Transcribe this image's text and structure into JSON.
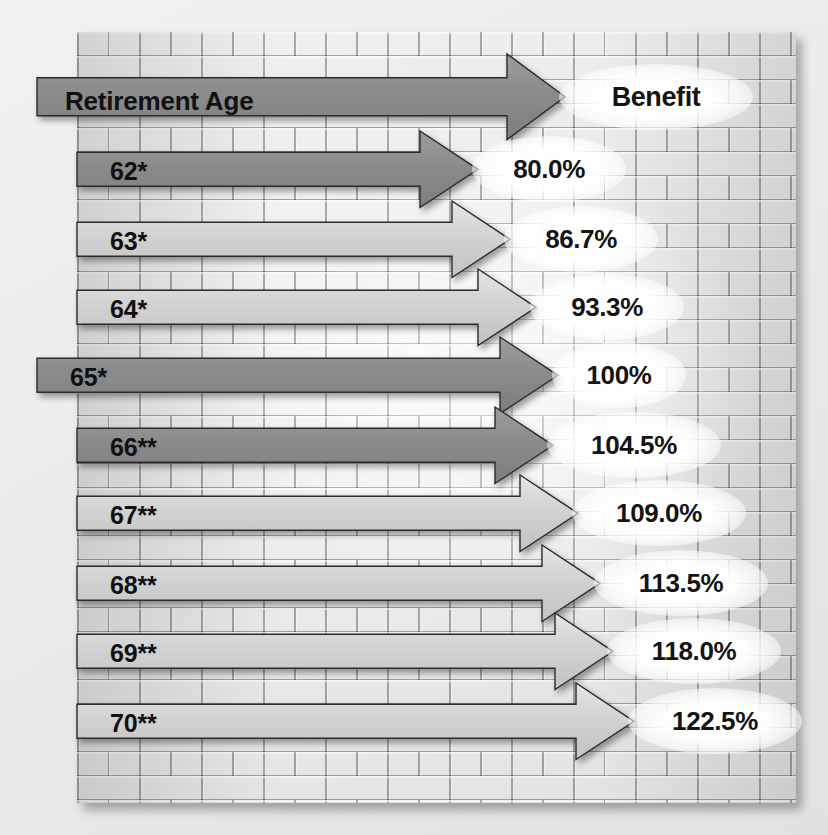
{
  "chart_data": {
    "type": "bar",
    "xlabel": "Benefit",
    "ylabel": "Retirement Age",
    "header": {
      "left": "Retirement Age",
      "right": "Benefit"
    },
    "categories": [
      "62*",
      "63*",
      "64*",
      "65*",
      "66**",
      "67**",
      "68**",
      "69**",
      "70**"
    ],
    "values": [
      80.0,
      86.7,
      93.3,
      100,
      104.5,
      109.0,
      113.5,
      118.0,
      122.5
    ],
    "value_labels": [
      "80.0%",
      "86.7%",
      "93.3%",
      "100%",
      "104.5%",
      "109.0%",
      "113.5%",
      "118.0%",
      "122.5%"
    ],
    "grid": true,
    "legend": "none",
    "accent_dark": "#8a8a8a",
    "accent_light": "#d8d8d8",
    "text_color": "#141414"
  },
  "rows": [
    {
      "id": "header",
      "label": "Retirement Age",
      "value": "Benefit",
      "shade": "dark",
      "start": -40,
      "tip": 488,
      "top": 78,
      "h": 38
    },
    {
      "id": "age-62",
      "label": "62*",
      "value": "80.0%",
      "shade": "dark",
      "start": 0,
      "tip": 401,
      "top": 152,
      "h": 34
    },
    {
      "id": "age-63",
      "label": "63*",
      "value": "86.7%",
      "shade": "light",
      "start": 0,
      "tip": 433,
      "top": 222,
      "h": 34
    },
    {
      "id": "age-64",
      "label": "64*",
      "value": "93.3%",
      "shade": "light",
      "start": 0,
      "tip": 459,
      "top": 290,
      "h": 34
    },
    {
      "id": "age-65",
      "label": "65*",
      "value": "100%",
      "shade": "dark",
      "start": -40,
      "tip": 481,
      "top": 358,
      "h": 34
    },
    {
      "id": "age-66",
      "label": "66**",
      "value": "104.5%",
      "shade": "dark",
      "start": 0,
      "tip": 476,
      "top": 428,
      "h": 34
    },
    {
      "id": "age-67",
      "label": "67**",
      "value": "109.0%",
      "shade": "light",
      "start": 0,
      "tip": 501,
      "top": 496,
      "h": 34
    },
    {
      "id": "age-68",
      "label": "68**",
      "value": "113.5%",
      "shade": "light",
      "start": 0,
      "tip": 523,
      "top": 566,
      "h": 34
    },
    {
      "id": "age-69",
      "label": "69**",
      "value": "118.0%",
      "shade": "light",
      "start": 0,
      "tip": 536,
      "top": 634,
      "h": 34
    },
    {
      "id": "age-70",
      "label": "70**",
      "value": "122.5%",
      "shade": "light",
      "start": 0,
      "tip": 557,
      "top": 704,
      "h": 34
    }
  ]
}
